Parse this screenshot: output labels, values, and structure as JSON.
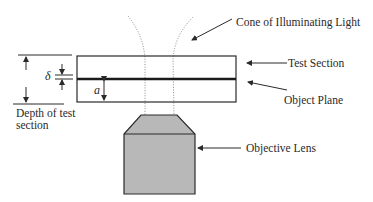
{
  "diagram": {
    "type": "microscope-test-section-schematic",
    "labels": {
      "cone": "Cone of Illuminating Light",
      "test_section": "Test Section",
      "object_plane": "Object Plane",
      "objective_lens": "Objective Lens",
      "depth_line1": "Depth of test",
      "depth_line2": "section",
      "delta": "δ",
      "a": "a"
    },
    "colors": {
      "stroke": "#2a2a2a",
      "lens_fill": "#b8b8b8",
      "cone_dots": "#8a8a8a",
      "background": "#ffffff"
    }
  }
}
